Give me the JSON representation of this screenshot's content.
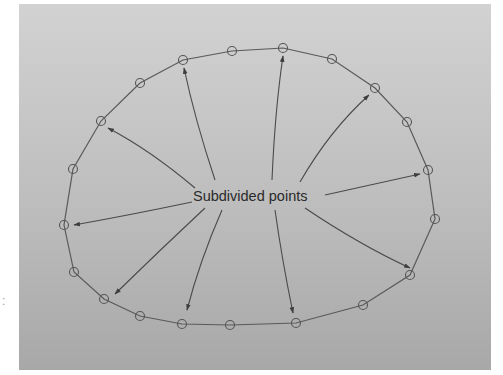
{
  "figure": {
    "annotation_label": "Subdivided points",
    "edge_mark": ":",
    "colors": {
      "panel_top": "#cfcfcf",
      "panel_bottom": "#a9a9a9",
      "stroke": "#555555"
    },
    "closed_curve": true,
    "point_count": 24,
    "arrow_count": 10
  }
}
